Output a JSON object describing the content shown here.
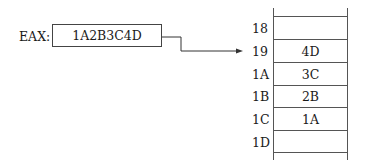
{
  "register": {
    "name": "EAX:",
    "value": "1A2B3C4D"
  },
  "memory": {
    "rows": [
      {
        "address": "18",
        "value": ""
      },
      {
        "address": "19",
        "value": "4D"
      },
      {
        "address": "1A",
        "value": "3C"
      },
      {
        "address": "1B",
        "value": "2B"
      },
      {
        "address": "1C",
        "value": "1A"
      },
      {
        "address": "1D",
        "value": ""
      }
    ]
  },
  "arrow": {
    "from": "register",
    "to_address": "19"
  }
}
